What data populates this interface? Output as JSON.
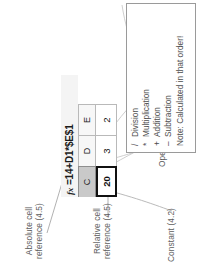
{
  "formula_bar": {
    "fx_glyph": "fx",
    "formula": "=14+D1*$E$1"
  },
  "sheet": {
    "column_headers": [
      "C",
      "D",
      "E"
    ],
    "row_cells": [
      {
        "column": "C",
        "value": "20",
        "selected": true
      },
      {
        "column": "D",
        "value": "3",
        "selected": false
      },
      {
        "column": "E",
        "value": "2",
        "selected": false
      }
    ]
  },
  "annotations": {
    "constant": "Constant (4.2)",
    "relative_reference_line1": "Relative cell",
    "relative_reference_line2": "reference (4.5)",
    "absolute_reference_line1": "Absolute cell",
    "absolute_reference_line2": "reference (4.5)",
    "operators": "Operators (4.2)",
    "cell_ranges": "Cell range(s) (4.2)"
  },
  "operators_legend": {
    "rows": [
      {
        "symbol": "/",
        "name": "Division"
      },
      {
        "symbol": "*",
        "name": "Multiplication"
      },
      {
        "symbol": "+",
        "name": "Addition"
      },
      {
        "symbol": "–",
        "name": "Subtraction"
      }
    ],
    "note": "Note: Calculated in that order!"
  },
  "colors": {
    "text": "#5d5d5d",
    "legend_border": "#9a9a9a",
    "connector": "#9b9b9b",
    "grid_line": "#b9b9b9",
    "selected_header": "#c9c9c9",
    "formula_bar_bg": "#f4f4f4"
  }
}
